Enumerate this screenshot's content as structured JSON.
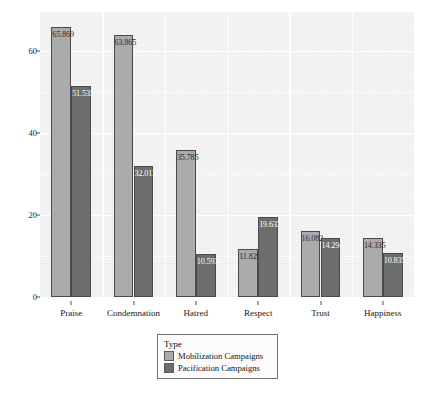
{
  "chart_data": {
    "type": "bar",
    "title": "",
    "xlabel": "",
    "ylabel": "",
    "categories": [
      "Praise",
      "Condemnation",
      "Hatred",
      "Respect",
      "Trust",
      "Happiness"
    ],
    "series": [
      {
        "name": "Mobilization Campaigns",
        "color": "#ababab",
        "values": [
          65.869,
          63.865,
          35.785,
          11.829,
          16.082,
          14.335
        ],
        "labels": [
          "65.869",
          "63.865",
          "35.785",
          "11.829",
          "16.082",
          "14.335"
        ]
      },
      {
        "name": "Pacification Campaigns",
        "color": "#6d6d6d",
        "values": [
          51.535,
          32.013,
          10.593,
          19.633,
          14.294,
          10.835
        ],
        "labels": [
          "51.535",
          "32.013",
          "10.593",
          "19.633",
          "14.294",
          "10.835"
        ]
      }
    ],
    "ylim": [
      0,
      69.5
    ],
    "yticks": [
      0,
      20,
      40,
      60
    ],
    "ytick_labels": [
      "0",
      "20",
      "40",
      "60"
    ],
    "grid": true,
    "legend_position": "bottom"
  },
  "legend": {
    "title": "Type",
    "entries": [
      {
        "label": "Mobilization Campaigns",
        "color": "#ababab"
      },
      {
        "label": "Pacification Campaigns",
        "color": "#6d6d6d"
      }
    ]
  },
  "caption": {
    "text": ""
  }
}
